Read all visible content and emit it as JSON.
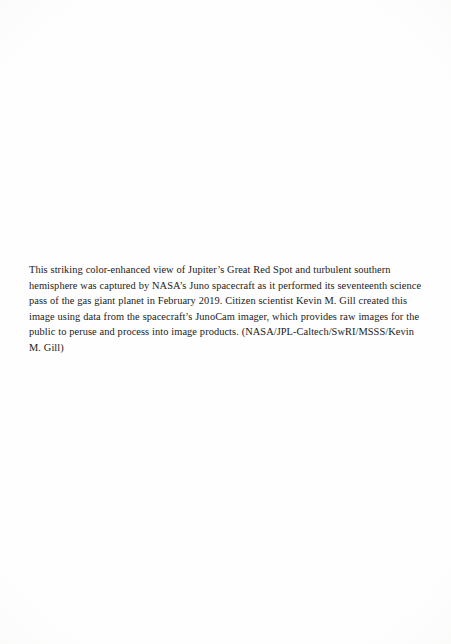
{
  "document": {
    "type": "book-page",
    "page_background_color": "#fefefe",
    "text_color": "#1a1a1a",
    "caption": {
      "body": "This striking color-enhanced view of Jupiter’s Great Red Spot and turbulent southern hemisphere was captured by NASA’s Juno spacecraft as it performed its seventeenth science pass of the gas giant planet in February 2019. Citizen scientist Kevin M. Gill created this image using data from the spacecraft’s JunoCam imager, which provides raw images for the public to peruse and process into image products. (NASA/JPL-Caltech/SwRI/MSSS/Kevin M. Gill)",
      "lines": [
        "This striking color-enhanced view of Jupiter’s Great Red Spot and turbulent southern",
        "hemisphere was captured by NASA’s Juno spacecraft as it performed its seventeenth",
        "science pass of the gas giant planet in February 2019. Citizen scientist Kevin M. Gill",
        "created this image using data from the spacecraft’s JunoCam imager, which provides",
        "raw images for the public to peruse and process into image products. (NASA/JPL-",
        "Caltech/SwRI/MSSS/Kevin M. Gill)"
      ],
      "credit": "NASA/JPL-Caltech/SwRI/MSSS/Kevin M. Gill",
      "year": "2019"
    }
  }
}
